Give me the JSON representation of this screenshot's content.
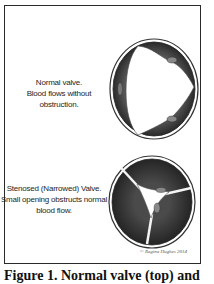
{
  "figure": {
    "panels": [
      {
        "id": "normal",
        "label_lines": [
          "Normal valve.",
          "Blood flows without obstruction."
        ],
        "illustration": "normal-valve-open"
      },
      {
        "id": "stenosed",
        "label_lines": [
          "Stenosed (Narrowed) Valve.",
          "Small opening obstructs normal",
          "blood flow."
        ],
        "illustration": "stenosed-valve-narrow-opening"
      }
    ],
    "signature": "© Regina Hughes 2014",
    "caption": "Figure 1. Normal valve (top) and"
  },
  "colors": {
    "frame_border": "#2a2a2a",
    "valve_dark": "#2b2b2b",
    "valve_mid": "#6a6a6a",
    "background": "#ffffff"
  }
}
